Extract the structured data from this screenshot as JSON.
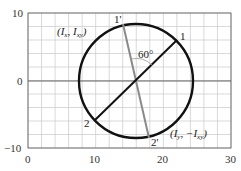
{
  "diagram": {
    "type": "mohr-circle",
    "x_axis": {
      "min": 0,
      "max": 30,
      "tick_labels": [
        "0",
        "10",
        "20",
        "30"
      ],
      "grid_step": 2
    },
    "y_axis": {
      "min": -10,
      "max": 10,
      "tick_labels": [
        "10",
        "0",
        "−10"
      ],
      "grid_step": 2
    },
    "circle": {
      "center_x": 16,
      "center_y": 0,
      "radius": 8.4
    },
    "points": [
      {
        "id": "1",
        "label": "1",
        "x": 22.1,
        "y": 6.0
      },
      {
        "id": "2",
        "label": "2",
        "x": 9.9,
        "y": -5.7
      },
      {
        "id": "1p",
        "label": "1'",
        "x": 14.0,
        "y": 8.4
      },
      {
        "id": "2p",
        "label": "2'",
        "x": 17.9,
        "y": -8.4
      }
    ],
    "angle_label": "60°",
    "annotations": {
      "top_left": {
        "open": "(",
        "a": "I",
        "a_sub": "x",
        "sep": ", ",
        "b": "I",
        "b_sub": "xy",
        "close": ")"
      },
      "bottom_right": {
        "open": "(",
        "a": "I",
        "a_sub": "y",
        "sep": ", −",
        "b": "I",
        "b_sub": "xy",
        "close": ")"
      }
    },
    "colors": {
      "grid": "#c8c8c8",
      "axis": "#555555",
      "circle": "#111111",
      "original_diameter": "#111111",
      "rotated_diameter": "#8a8a8a"
    }
  }
}
